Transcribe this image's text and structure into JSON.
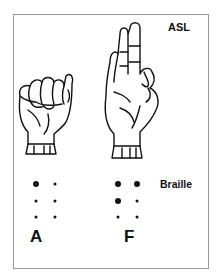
{
  "labels": {
    "asl": "ASL",
    "braille": "Braille"
  },
  "letters": [
    {
      "letter": "A",
      "hand_icon": "asl-fist-hand-A",
      "braille_cells": [
        [
          1,
          0
        ],
        [
          0,
          0
        ],
        [
          0,
          0
        ]
      ]
    },
    {
      "letter": "F",
      "hand_icon": "asl-hand-F",
      "braille_cells": [
        [
          1,
          1
        ],
        [
          1,
          0
        ],
        [
          0,
          0
        ]
      ]
    }
  ],
  "colors": {
    "ink": "#111111",
    "border": "#9a9a9a",
    "background": "#ffffff"
  }
}
